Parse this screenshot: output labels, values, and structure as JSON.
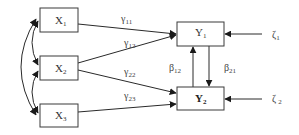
{
  "diagram": {
    "type": "path-diagram",
    "nodes": {
      "x1": {
        "base": "X",
        "sub": "1"
      },
      "x2": {
        "base": "X",
        "sub": "2"
      },
      "x3": {
        "base": "X",
        "sub": "3"
      },
      "y1": {
        "base": "Y",
        "sub": "1"
      },
      "y2": {
        "base": "Y",
        "sub": "2"
      }
    },
    "disturbances": {
      "zeta1": {
        "base": "ζ",
        "sub": "1"
      },
      "zeta2": {
        "base": "ζ",
        "sub": "2"
      }
    },
    "coefficients": {
      "gamma11": {
        "base": "γ",
        "sub": "11"
      },
      "gamma12": {
        "base": "γ",
        "sub": "12"
      },
      "gamma22": {
        "base": "γ",
        "sub": "22"
      },
      "gamma23": {
        "base": "γ",
        "sub": "23"
      },
      "beta12": {
        "base": "β",
        "sub": "12"
      },
      "beta21": {
        "base": "β",
        "sub": "21"
      }
    },
    "edges": [
      {
        "from": "X1",
        "to": "Y1",
        "label": "γ11"
      },
      {
        "from": "X2",
        "to": "Y1",
        "label": "γ12"
      },
      {
        "from": "X2",
        "to": "Y2",
        "label": "γ22"
      },
      {
        "from": "X3",
        "to": "Y2",
        "label": "γ23"
      },
      {
        "from": "Y2",
        "to": "Y1",
        "label": "β12"
      },
      {
        "from": "Y1",
        "to": "Y2",
        "label": "β21"
      },
      {
        "from": "ζ1",
        "to": "Y1"
      },
      {
        "from": "ζ2",
        "to": "Y2"
      }
    ],
    "correlations": [
      {
        "between": [
          "X1",
          "X2"
        ]
      },
      {
        "between": [
          "X2",
          "X3"
        ]
      },
      {
        "between": [
          "X1",
          "X3"
        ]
      }
    ]
  }
}
